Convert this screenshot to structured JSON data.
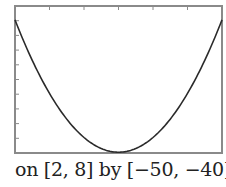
{
  "chart_data": {
    "type": "line",
    "title": "",
    "xlabel": "",
    "ylabel": "",
    "xlim": [
      2,
      8
    ],
    "ylim": [
      -50,
      -40
    ],
    "x_tick_step": 1,
    "y_tick_step": 1,
    "grid": false,
    "legend": null,
    "series": [
      {
        "name": "y = (x - 5)^2 - 50",
        "x": [
          2,
          2.5,
          3,
          3.5,
          4,
          4.5,
          5,
          5.5,
          6,
          6.5,
          7,
          7.5,
          8
        ],
        "values": [
          -41,
          -43.75,
          -46,
          -47.75,
          -49,
          -49.75,
          -50,
          -49.75,
          -49,
          -47.75,
          -46,
          -43.75,
          -41
        ]
      }
    ],
    "caption": "on [2, 8] by [−50, −40]"
  },
  "colors": {
    "frame": "#8a8a8a",
    "curve": "#2a2a2a",
    "text": "#222222",
    "background": "#ffffff"
  },
  "caption": {
    "text": "on [2, 8] by [−50, −40]"
  }
}
